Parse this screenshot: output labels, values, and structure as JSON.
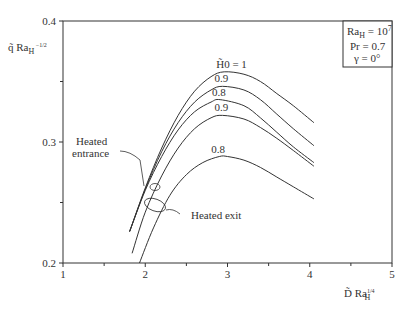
{
  "chart_data": {
    "type": "line",
    "title": "",
    "xlabel": "D̃ Ra_H^{1/4}",
    "ylabel": "q̃ Ra_H^{-1/2}",
    "xlim": [
      1,
      5
    ],
    "ylim": [
      0.2,
      0.4
    ],
    "x_ticks": [
      "1",
      "2",
      "3",
      "4",
      "5"
    ],
    "y_ticks": [
      "0.2",
      "0.3",
      "0.4"
    ],
    "grid": false,
    "legend_box": [
      "Ra_H = 10^7",
      "Pr = 0.7",
      "γ = 0°"
    ],
    "series": [
      {
        "name": "H̃0 = 1",
        "label": "H̃0 = 1",
        "group": "entrance",
        "x": [
          1.81,
          2.0,
          2.2,
          2.4,
          2.6,
          2.8,
          2.96,
          3.2,
          3.4,
          3.6,
          3.8,
          4.05
        ],
        "y": [
          0.226,
          0.262,
          0.295,
          0.322,
          0.342,
          0.354,
          0.358,
          0.356,
          0.35,
          0.34,
          0.33,
          0.316
        ]
      },
      {
        "name": "0.9 (entrance)",
        "label": "0.9",
        "group": "entrance",
        "x": [
          1.81,
          2.0,
          2.2,
          2.4,
          2.6,
          2.8,
          2.94,
          3.2,
          3.4,
          3.6,
          3.8,
          4.05
        ],
        "y": [
          0.226,
          0.261,
          0.292,
          0.316,
          0.333,
          0.343,
          0.346,
          0.343,
          0.335,
          0.323,
          0.311,
          0.297
        ]
      },
      {
        "name": "0.8 (entrance)",
        "label": "0.8",
        "group": "entrance",
        "x": [
          1.81,
          2.0,
          2.2,
          2.4,
          2.6,
          2.8,
          2.91,
          3.2,
          3.4,
          3.6,
          3.8,
          4.05
        ],
        "y": [
          0.226,
          0.26,
          0.288,
          0.31,
          0.325,
          0.333,
          0.335,
          0.33,
          0.32,
          0.308,
          0.296,
          0.283
        ]
      },
      {
        "name": "0.9 (exit)",
        "label": "0.9",
        "group": "exit",
        "x": [
          1.84,
          2.0,
          2.2,
          2.4,
          2.6,
          2.8,
          2.94,
          3.2,
          3.4,
          3.6,
          3.8,
          4.05
        ],
        "y": [
          0.208,
          0.242,
          0.272,
          0.295,
          0.311,
          0.32,
          0.322,
          0.319,
          0.312,
          0.303,
          0.293,
          0.28
        ]
      },
      {
        "name": "0.8 (exit)",
        "label": "0.8",
        "group": "exit",
        "x": [
          1.93,
          2.1,
          2.3,
          2.5,
          2.7,
          2.9,
          3.0,
          3.2,
          3.4,
          3.6,
          3.8,
          4.05
        ],
        "y": [
          0.2,
          0.229,
          0.256,
          0.273,
          0.283,
          0.288,
          0.288,
          0.285,
          0.279,
          0.271,
          0.263,
          0.253
        ]
      }
    ],
    "annotations": [
      {
        "text": "Heated entrance",
        "lines": [
          "Heated",
          "entrance"
        ],
        "target_x": 2.13,
        "target_y": 0.284
      },
      {
        "text": "Heated exit",
        "lines": [
          "Heated exit"
        ],
        "target_x": 2.12,
        "target_y": 0.248
      }
    ]
  }
}
